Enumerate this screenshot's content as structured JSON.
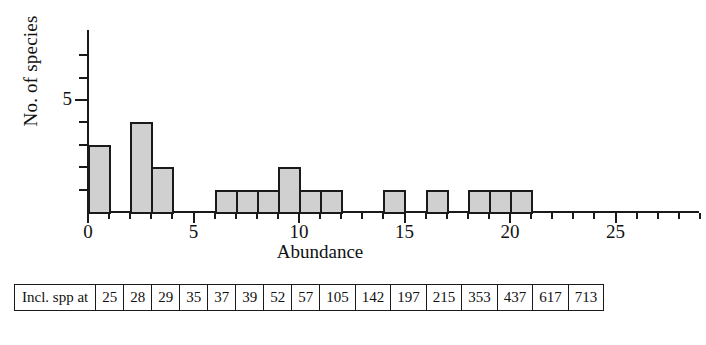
{
  "chart_data": {
    "type": "bar",
    "title": "",
    "subtitle": "",
    "xlabel": "Abundance",
    "ylabel": "No. of species",
    "xlim": [
      0,
      29
    ],
    "ylim": [
      0,
      7
    ],
    "grid": false,
    "legend": null,
    "bin_width": 1,
    "x_tick_labels": [
      "0",
      "5",
      "10",
      "15",
      "20",
      "25"
    ],
    "x_tick_values": [
      0,
      5,
      10,
      15,
      20,
      25
    ],
    "x_minor_ticks": [
      1,
      2,
      3,
      4,
      6,
      7,
      8,
      9,
      11,
      12,
      13,
      14,
      16,
      17,
      18,
      19,
      21,
      22,
      23,
      24,
      26,
      27,
      28,
      29
    ],
    "y_tick_labels": [
      "5"
    ],
    "y_tick_values": [
      5
    ],
    "y_minor_ticks": [
      1,
      2,
      3,
      4,
      6,
      7
    ],
    "categories": [
      0,
      1,
      2,
      3,
      4,
      5,
      6,
      7,
      8,
      9,
      10,
      11,
      12,
      13,
      14,
      15,
      16,
      17,
      18,
      19,
      20,
      21,
      22,
      23,
      24,
      25,
      26,
      27,
      28
    ],
    "values": [
      3,
      0,
      4,
      2,
      0,
      0,
      1,
      1,
      1,
      2,
      1,
      1,
      0,
      0,
      1,
      0,
      1,
      0,
      1,
      1,
      1,
      0,
      0,
      0,
      0,
      0,
      0,
      0,
      0
    ],
    "bars": [
      {
        "x": 0,
        "height": 3
      },
      {
        "x": 2,
        "height": 4
      },
      {
        "x": 3,
        "height": 2
      },
      {
        "x": 6,
        "height": 1
      },
      {
        "x": 7,
        "height": 1
      },
      {
        "x": 8,
        "height": 1
      },
      {
        "x": 9,
        "height": 2
      },
      {
        "x": 10,
        "height": 1
      },
      {
        "x": 11,
        "height": 1
      },
      {
        "x": 14,
        "height": 1
      },
      {
        "x": 16,
        "height": 1
      },
      {
        "x": 18,
        "height": 1
      },
      {
        "x": 19,
        "height": 1
      },
      {
        "x": 20,
        "height": 1
      }
    ],
    "colors": {
      "bar_fill": "#d0d0d0",
      "bar_stroke": "#1a1a1a",
      "axis": "#1a1a1a",
      "text": "#111111"
    }
  },
  "table": {
    "row_header": "Incl. spp at",
    "values": [
      "25",
      "28",
      "29",
      "35",
      "37",
      "39",
      "52",
      "57",
      "105",
      "142",
      "197",
      "215",
      "353",
      "437",
      "617",
      "713"
    ]
  }
}
